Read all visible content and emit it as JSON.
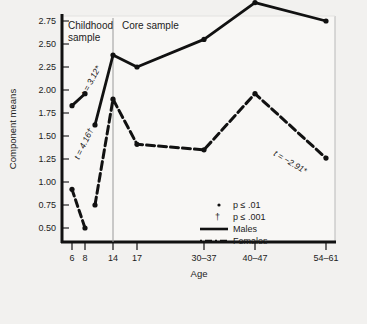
{
  "chart_data": {
    "type": "line",
    "title": "",
    "xlabel": "Age",
    "ylabel": "Component means",
    "categories": [
      "6",
      "8",
      "14",
      "17",
      "30–37",
      "40–47",
      "54–61"
    ],
    "ylim": [
      0.5,
      3.0
    ],
    "yticks": [
      "0.50",
      "0.75",
      "1.00",
      "1.25",
      "1.50",
      "1.75",
      "2.00",
      "2.25",
      "2.50",
      "2.75"
    ],
    "grid": false,
    "legend_position": "inside-bottom-right",
    "panels": [
      {
        "name": "childhood-sample",
        "label": "Childhood\nsample",
        "line1": "Childhood",
        "line2": "sample"
      },
      {
        "name": "core-sample",
        "label": "Core sample",
        "line1": "Core sample",
        "line2": ""
      }
    ],
    "series": [
      {
        "name": "Males",
        "style": "solid",
        "childhood": {
          "x": [
            "6",
            "8"
          ],
          "values": [
            1.83,
            1.96
          ]
        },
        "core": {
          "x": [
            "8",
            "14",
            "17",
            "30–37",
            "40–47",
            "54–61"
          ],
          "values": [
            1.62,
            2.38,
            2.25,
            2.55,
            2.95,
            2.75
          ]
        }
      },
      {
        "name": "Females",
        "style": "dashed",
        "childhood": {
          "x": [
            "6",
            "8"
          ],
          "values": [
            0.92,
            0.5
          ]
        },
        "core": {
          "x": [
            "8",
            "14",
            "17",
            "30–37",
            "40–47",
            "54–61"
          ],
          "values": [
            0.75,
            1.9,
            1.41,
            1.35,
            1.96,
            1.26
          ]
        }
      }
    ],
    "annotations": [
      {
        "name": "t-males-childhood-core",
        "text": "t = 3.12*",
        "series": "Males"
      },
      {
        "name": "t-females-childhood-core",
        "text": "t = 4.16†",
        "series": "Females"
      },
      {
        "name": "t-females-decline",
        "text": "t = −2.91*",
        "series": "Females"
      }
    ],
    "legend": [
      {
        "name": "p-01",
        "marker": "dot",
        "text": "p ≤ .01",
        "symbol": "*"
      },
      {
        "name": "p-001",
        "marker": "dagger",
        "text": "p ≤ .001",
        "symbol": "†"
      },
      {
        "name": "males",
        "marker": "solid-line",
        "text": "Males",
        "symbol": ""
      },
      {
        "name": "females",
        "marker": "dashed-line",
        "text": "Females",
        "symbol": ""
      }
    ],
    "colors": {
      "ink": "#111111",
      "background": "#f2f1ef",
      "plot_background": "#f7f6f4",
      "divider": "#9a9a9a"
    }
  }
}
